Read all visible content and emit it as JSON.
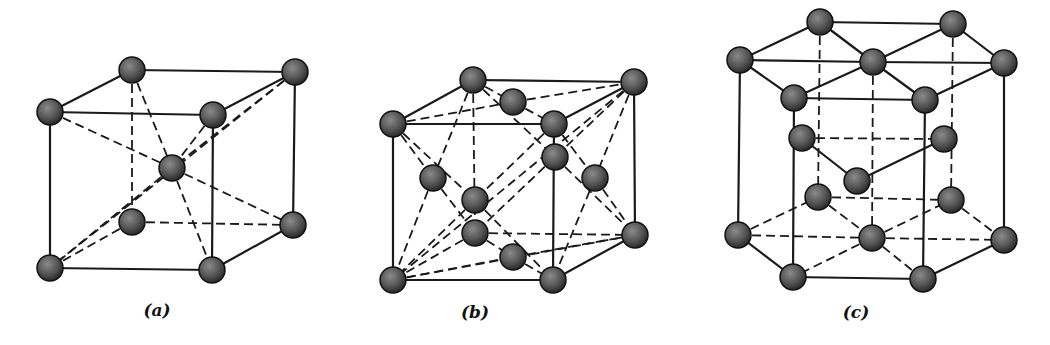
{
  "figure": {
    "atom_color": "#4a4a4a",
    "line_color": "#1a1a1a",
    "atom_radius": 13,
    "panels": [
      {
        "id": "a",
        "label": "(a)",
        "structure": "body-centered cubic",
        "label_pos": [
          157,
          316
        ],
        "atoms": [
          [
            132,
            70
          ],
          [
            295,
            72
          ],
          [
            50,
            112
          ],
          [
            213,
            115
          ],
          [
            172,
            168
          ],
          [
            132,
            222
          ],
          [
            293,
            225
          ],
          [
            50,
            268
          ],
          [
            212,
            270
          ]
        ],
        "solid_edges": [
          [
            2,
            3
          ],
          [
            2,
            0
          ],
          [
            0,
            1
          ],
          [
            1,
            3
          ],
          [
            3,
            8
          ],
          [
            1,
            6
          ],
          [
            2,
            7
          ],
          [
            7,
            8
          ],
          [
            8,
            6
          ]
        ],
        "dashed_edges": [
          [
            0,
            5
          ],
          [
            5,
            6
          ],
          [
            5,
            7
          ],
          [
            2,
            4
          ],
          [
            4,
            6
          ],
          [
            0,
            4
          ],
          [
            4,
            8
          ],
          [
            1,
            4
          ],
          [
            4,
            7
          ],
          [
            3,
            4
          ],
          [
            1,
            7
          ]
        ]
      },
      {
        "id": "b",
        "label": "(b)",
        "structure": "face-centered cubic",
        "label_pos": [
          475,
          318
        ],
        "atoms": [
          [
            473,
            80
          ],
          [
            634,
            82
          ],
          [
            393,
            124
          ],
          [
            554,
            124
          ],
          [
            513,
            102
          ],
          [
            555,
            157
          ],
          [
            433,
            178
          ],
          [
            595,
            178
          ],
          [
            475,
            200
          ],
          [
            475,
            233
          ],
          [
            635,
            235
          ],
          [
            513,
            257
          ],
          [
            393,
            280
          ],
          [
            553,
            280
          ]
        ],
        "solid_edges": [
          [
            2,
            3
          ],
          [
            2,
            0
          ],
          [
            0,
            1
          ],
          [
            1,
            3
          ],
          [
            2,
            12
          ],
          [
            3,
            13
          ],
          [
            1,
            10
          ],
          [
            12,
            13
          ],
          [
            13,
            10
          ]
        ],
        "dashed_edges": [
          [
            0,
            9
          ],
          [
            9,
            10
          ],
          [
            9,
            12
          ],
          [
            2,
            4
          ],
          [
            4,
            1
          ],
          [
            0,
            4
          ],
          [
            4,
            3
          ],
          [
            2,
            6
          ],
          [
            6,
            12
          ],
          [
            0,
            6
          ],
          [
            6,
            9
          ],
          [
            2,
            8
          ],
          [
            8,
            13
          ],
          [
            3,
            8
          ],
          [
            8,
            12
          ],
          [
            3,
            7
          ],
          [
            7,
            10
          ],
          [
            1,
            7
          ],
          [
            7,
            13
          ],
          [
            1,
            5
          ],
          [
            5,
            9
          ],
          [
            0,
            5
          ],
          [
            5,
            10
          ],
          [
            12,
            11
          ],
          [
            11,
            10
          ],
          [
            9,
            11
          ],
          [
            11,
            13
          ],
          [
            12,
            10
          ],
          [
            1,
            12
          ]
        ]
      },
      {
        "id": "c",
        "label": "(c)",
        "structure": "hexagonal close-packed",
        "label_pos": [
          856,
          318
        ],
        "atoms": [
          [
            820,
            22
          ],
          [
            953,
            24
          ],
          [
            740,
            60
          ],
          [
            873,
            62
          ],
          [
            1004,
            63
          ],
          [
            794,
            98
          ],
          [
            925,
            100
          ],
          [
            802,
            138
          ],
          [
            944,
            139
          ],
          [
            857,
            181
          ],
          [
            818,
            197
          ],
          [
            951,
            200
          ],
          [
            738,
            235
          ],
          [
            872,
            238
          ],
          [
            1004,
            240
          ],
          [
            793,
            277
          ],
          [
            923,
            279
          ]
        ],
        "solid_edges": [
          [
            0,
            1
          ],
          [
            0,
            2
          ],
          [
            2,
            5
          ],
          [
            5,
            6
          ],
          [
            6,
            4
          ],
          [
            4,
            1
          ],
          [
            2,
            3
          ],
          [
            3,
            4
          ],
          [
            0,
            3
          ],
          [
            3,
            5
          ],
          [
            1,
            3
          ],
          [
            3,
            6
          ],
          [
            2,
            12
          ],
          [
            5,
            15
          ],
          [
            6,
            16
          ],
          [
            4,
            14
          ],
          [
            12,
            15
          ],
          [
            15,
            16
          ],
          [
            16,
            14
          ],
          [
            7,
            9
          ],
          [
            9,
            8
          ]
        ],
        "dashed_edges": [
          [
            0,
            10
          ],
          [
            3,
            13
          ],
          [
            1,
            11
          ],
          [
            12,
            10
          ],
          [
            10,
            11
          ],
          [
            11,
            14
          ],
          [
            10,
            13
          ],
          [
            13,
            15
          ],
          [
            13,
            11
          ],
          [
            13,
            16
          ],
          [
            7,
            8
          ],
          [
            12,
            13
          ],
          [
            13,
            14
          ]
        ]
      }
    ]
  }
}
